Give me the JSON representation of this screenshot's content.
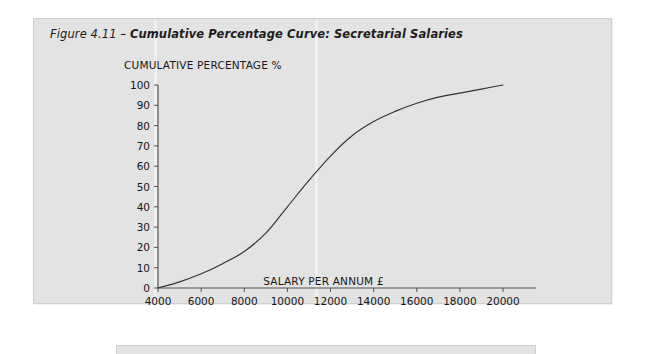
{
  "figure": {
    "caption_lead": "Figure 4.11",
    "caption_dash": " – ",
    "caption_title": "Cumulative Percentage Curve: Secretarial Salaries",
    "panel_color": "#e3e3e3",
    "curve_color": "#333333",
    "axis_color": "#555555",
    "text_color": "#171717"
  },
  "chart_data": {
    "type": "line",
    "title": "Cumulative Percentage Curve: Secretarial Salaries",
    "subtitle": "",
    "xlabel": "SALARY PER ANNUM £",
    "ylabel": "CUMULATIVE PERCENTAGE %",
    "xlim": [
      4000,
      20000
    ],
    "ylim": [
      0,
      100
    ],
    "grid": false,
    "legend": null,
    "legend_position": "none",
    "xticks": [
      4000,
      6000,
      8000,
      10000,
      12000,
      14000,
      16000,
      18000,
      20000
    ],
    "xtick_labels": [
      "4000",
      "6000",
      "8000",
      "10000",
      "12000",
      "14000",
      "16000",
      "18000",
      "20000"
    ],
    "yticks": [
      0,
      10,
      20,
      30,
      40,
      50,
      60,
      70,
      80,
      90,
      100
    ],
    "ytick_labels": [
      "0",
      "10",
      "20",
      "30",
      "40",
      "50",
      "60",
      "70",
      "80",
      "90",
      "100"
    ],
    "series": [
      {
        "name": "Cumulative percentage",
        "x": [
          4000,
          5000,
          6000,
          7000,
          8000,
          9000,
          10000,
          11000,
          12000,
          13000,
          14000,
          15000,
          16000,
          17000,
          18000,
          19000,
          20000
        ],
        "values": [
          0,
          3,
          7,
          12,
          18,
          27,
          40,
          53,
          65,
          75,
          82,
          87,
          91,
          94,
          96,
          98,
          100
        ]
      }
    ],
    "annotations": []
  }
}
